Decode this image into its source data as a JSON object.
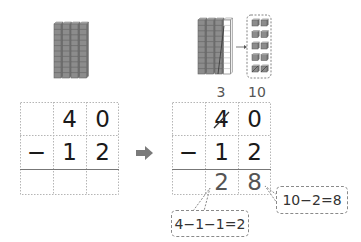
{
  "left_panel": {
    "blocks": {
      "tens_rods": 4
    },
    "problem": {
      "operator": "−",
      "minuend": [
        "4",
        "0"
      ],
      "subtrahend": [
        "1",
        "2"
      ],
      "result": [
        "",
        ""
      ]
    }
  },
  "arrow": {
    "icon": "right-arrow-icon"
  },
  "right_panel": {
    "blocks": {
      "tens_rods_remaining": 3,
      "tens_rod_regrouped": 1,
      "ones_cubes": 10
    },
    "regroup": {
      "tens_label": "3",
      "ones_label": "10"
    },
    "problem": {
      "operator": "−",
      "minuend": [
        "4",
        "0"
      ],
      "minuend_crossed": [
        true,
        false
      ],
      "subtrahend": [
        "1",
        "2"
      ],
      "result": [
        "2",
        "8"
      ]
    },
    "callouts": {
      "ones": "10−2=8",
      "tens": "4−1−1=2"
    }
  },
  "colors": {
    "ink": "#1a1a1a",
    "result_ink": "#555555",
    "grid_dashed": "#b5b5b5",
    "rod_fill": "#8c8c8c"
  }
}
